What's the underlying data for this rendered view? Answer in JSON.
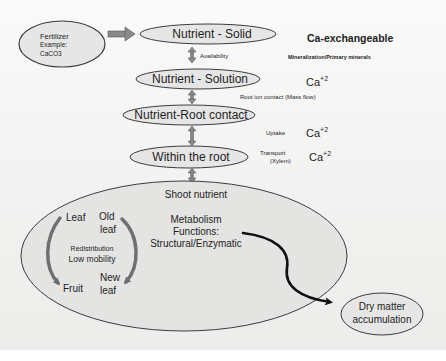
{
  "diagram": {
    "fertilizer": {
      "line1": "Fertilizer",
      "line2": "Example:",
      "line3": "CaCO3"
    },
    "nodes": {
      "solid": "Nutrient - Solid",
      "solution": "Nutrient - Solution",
      "root_contact": "Nutrient-Root contact",
      "within_root": "Within the root",
      "dry_matter_line1": "Dry matter",
      "dry_matter_line2": "accumulation"
    },
    "transitions": {
      "availability": "Availability",
      "root_ion_contact": "Root ion contact  (Mass flow)",
      "uptake": "Uptake",
      "transport_line1": "Transport",
      "transport_line2": "(Xylem)"
    },
    "right_column": {
      "ca_exchangeable": "Ca-exchangeable",
      "mineralization": "Mineralization/Primary minerals",
      "ca_symbol": "Ca",
      "ca_charge": "+2"
    },
    "shoot": {
      "title": "Shoot nutrient",
      "metabolism": "Metabolism",
      "functions": "Functions:",
      "structural": "Structural/Enzymatic",
      "leaf": "Leaf",
      "old_leaf_line1": "Old",
      "old_leaf_line2": "leaf",
      "new_leaf_line1": "New",
      "new_leaf_line2": "leaf",
      "fruit": "Fruit",
      "redistribution": "Redistribution",
      "low_mobility": "Low mobility"
    },
    "colors": {
      "node_fill": "#e6e6e6",
      "node_stroke": "#3c3c3c",
      "arrow_gray": "#7a7a7a",
      "arrow_black": "#111111",
      "text": "#1e1e1e"
    }
  }
}
